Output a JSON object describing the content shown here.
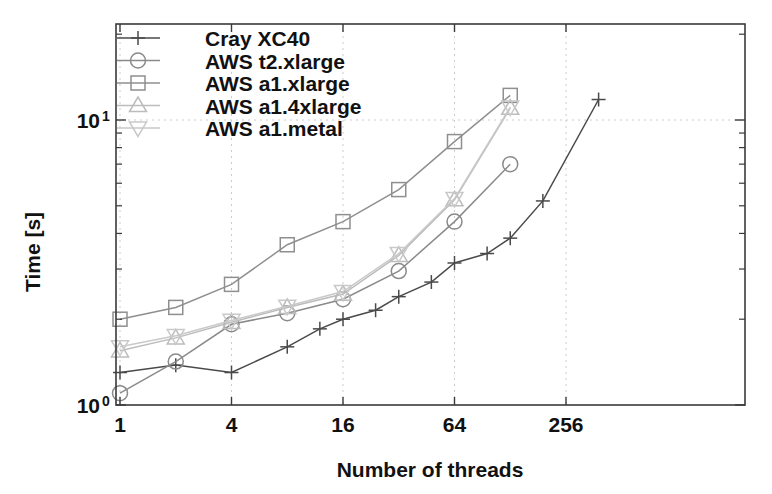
{
  "chart_data": {
    "type": "line",
    "title": "",
    "xlabel": "Number of threads",
    "ylabel": "Time [s]",
    "xscale": "log",
    "yscale": "log",
    "xlim": [
      1,
      512
    ],
    "ylim": [
      1,
      14
    ],
    "xticks": [
      1,
      4,
      16,
      64,
      256
    ],
    "xtick_labels": [
      "1",
      "4",
      "16",
      "64",
      "256"
    ],
    "yticks": [
      1,
      10
    ],
    "ytick_labels": [
      "10",
      "10"
    ],
    "ytick_exponents": [
      "0",
      "1"
    ],
    "grid": true,
    "legend_position": "top-left",
    "series": [
      {
        "name": "Cray XC40",
        "marker": "plus",
        "color": "#4a4a4a",
        "x": [
          1,
          2,
          4,
          8,
          12,
          16,
          24,
          32,
          48,
          64,
          96,
          128,
          192,
          384
        ],
        "y": [
          1.3,
          1.38,
          1.3,
          1.6,
          1.85,
          2.0,
          2.15,
          2.4,
          2.7,
          3.15,
          3.4,
          3.85,
          5.2,
          11.8
        ]
      },
      {
        "name": "AWS t2.xlarge",
        "marker": "circle",
        "color": "#8a8a8a",
        "x": [
          1,
          2,
          4,
          8,
          16,
          32,
          64,
          128
        ],
        "y": [
          1.1,
          1.42,
          1.92,
          2.1,
          2.35,
          2.95,
          4.4,
          7.0
        ]
      },
      {
        "name": "AWS a1.xlarge",
        "marker": "square",
        "color": "#8f8f8f",
        "x": [
          1,
          2,
          4,
          8,
          16,
          32,
          64,
          128
        ],
        "y": [
          2.0,
          2.2,
          2.65,
          3.65,
          4.4,
          5.7,
          8.4,
          12.2
        ]
      },
      {
        "name": "AWS a1.4xlarge",
        "marker": "triangle-up",
        "color": "#bcbcbc",
        "x": [
          1,
          2,
          4,
          8,
          16,
          32,
          64,
          128
        ],
        "y": [
          1.55,
          1.72,
          1.95,
          2.2,
          2.45,
          3.35,
          5.25,
          11.0
        ]
      },
      {
        "name": "AWS a1.metal",
        "marker": "triangle-down",
        "color": "#c9c9c9",
        "x": [
          1,
          2,
          4,
          8,
          16,
          32,
          64,
          128
        ],
        "y": [
          1.6,
          1.75,
          1.98,
          2.22,
          2.5,
          3.4,
          5.3,
          11.1
        ]
      }
    ]
  },
  "legend": {
    "items": [
      {
        "label": "Cray XC40",
        "marker": "plus",
        "color": "#4a4a4a"
      },
      {
        "label": "AWS t2.xlarge",
        "marker": "circle",
        "color": "#8a8a8a"
      },
      {
        "label": "AWS a1.xlarge",
        "marker": "square",
        "color": "#8f8f8f"
      },
      {
        "label": "AWS a1.4xlarge",
        "marker": "triangle-up",
        "color": "#bcbcbc"
      },
      {
        "label": "AWS a1.metal",
        "marker": "triangle-down",
        "color": "#c9c9c9"
      }
    ]
  },
  "axes": {
    "x_title": "Number of threads",
    "y_title": "Time [s]",
    "x_tick_labels": [
      "1",
      "4",
      "16",
      "64",
      "256"
    ],
    "y_tick_mantissa": "10",
    "y_tick_exp_low": "0",
    "y_tick_exp_high": "1"
  },
  "colors": {
    "frame": "#3a3a3a",
    "grid": "#cccccc",
    "background": "#ffffff",
    "text": "#111111"
  }
}
